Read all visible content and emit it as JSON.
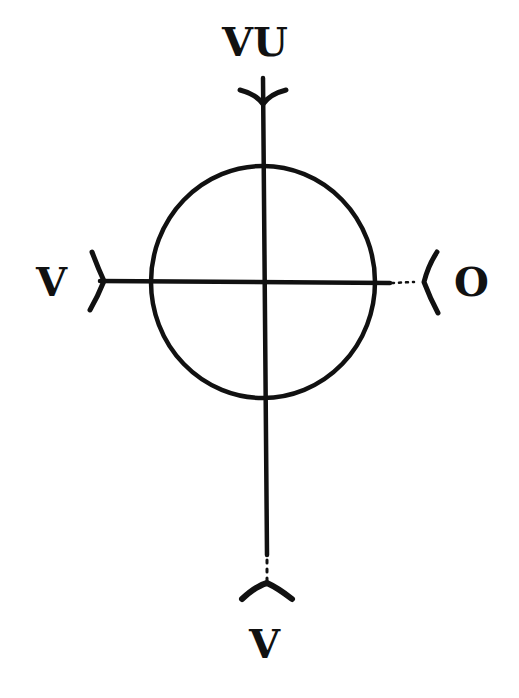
{
  "diagram": {
    "type": "cross-with-circle",
    "labels": {
      "top": "VU",
      "left": "V",
      "right": "O",
      "bottom": "V"
    },
    "colors": {
      "stroke": "#111111",
      "background": "#ffffff"
    },
    "arrowheads": {
      "top": "open-v-pointing-down",
      "left": "open-v-pointing-right",
      "right": "open-v-pointing-left",
      "bottom": "open-caret-pointing-up"
    }
  }
}
